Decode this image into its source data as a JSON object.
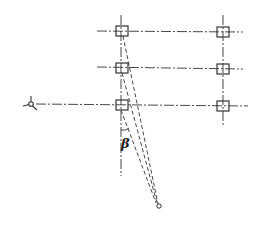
{
  "diagram": {
    "type": "survey-setting-out-plan",
    "angle_label": "β",
    "colors": {
      "stroke": "#333333",
      "background": "#ffffff"
    },
    "grid": {
      "columns_x": [
        122,
        223
      ],
      "rows_y": [
        31,
        68,
        105
      ],
      "markers": [
        {
          "col": 0,
          "row": 0
        },
        {
          "col": 1,
          "row": 0
        },
        {
          "col": 0,
          "row": 1
        },
        {
          "col": 1,
          "row": 1
        },
        {
          "col": 0,
          "row": 2
        },
        {
          "col": 1,
          "row": 2
        }
      ]
    },
    "instrument_station": {
      "x": 31,
      "y": 104,
      "icon": "tripod-icon"
    },
    "observation_point": {
      "x": 159,
      "y": 206,
      "icon": "point-circle-icon"
    }
  }
}
